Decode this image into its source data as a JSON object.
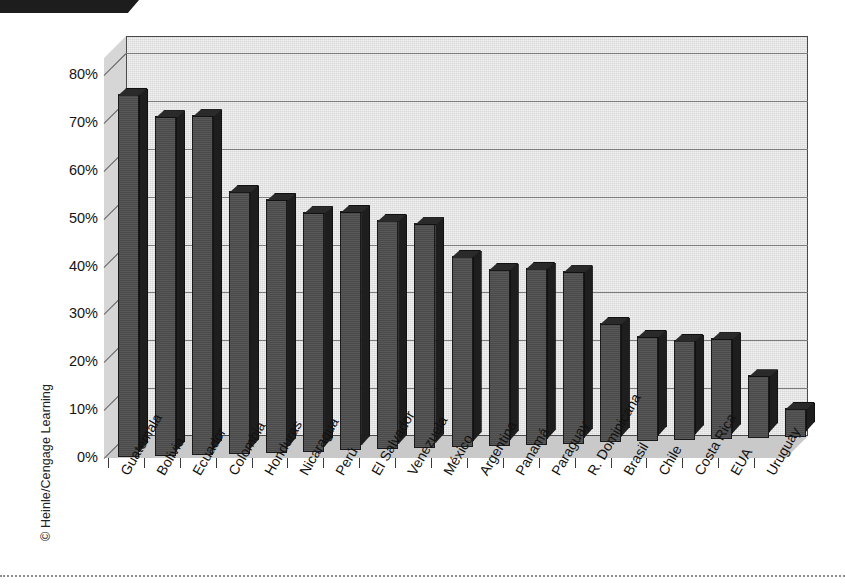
{
  "page": {
    "copyright": "© Heinle/Cengage Learning",
    "tab_color": "#1d1d1d",
    "background": "#ffffff"
  },
  "chart_data": {
    "type": "bar",
    "title": "",
    "subtitle": "",
    "xlabel": "",
    "ylabel": "",
    "ylim": [
      0,
      80
    ],
    "grid": true,
    "legend": false,
    "style": "3d-column",
    "bar_color": "#4e4e4e",
    "panel_color": "#e2e2e2",
    "axis_color": "#4a4a4a",
    "yticks": [
      0,
      10,
      20,
      30,
      40,
      50,
      60,
      70,
      80
    ],
    "ytick_labels": [
      "0%",
      "10%",
      "20%",
      "30%",
      "40%",
      "50%",
      "60%",
      "70%",
      "80%"
    ],
    "categories": [
      "Guatemala",
      "Bolivia",
      "Ecuador",
      "Colombia",
      "Honduras",
      "Nicaragua",
      "Perú",
      "El Salvador",
      "Venezuela",
      "México",
      "Argentina",
      "Panamá",
      "Paraguay",
      "R. Dominicana",
      "Brasil",
      "Chile",
      "Costa Rica",
      "EUA",
      "Uruguay"
    ],
    "values": [
      76,
      71,
      71,
      55,
      53,
      50,
      50,
      48,
      47,
      40,
      37,
      37,
      36,
      25,
      22,
      21,
      21,
      13,
      6
    ],
    "value_labels": [
      "76%",
      "71%",
      "71%",
      "55%",
      "53%",
      "50%",
      "50%",
      "48%",
      "47%",
      "40%",
      "37%",
      "37%",
      "36%",
      "25%",
      "22%",
      "21%",
      "21%",
      "13%",
      "6%"
    ]
  }
}
